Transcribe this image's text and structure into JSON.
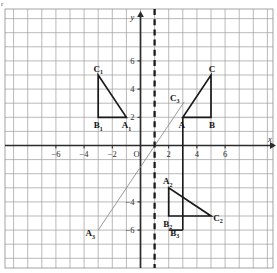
{
  "figure": {
    "kind": "coordinate-grid-geometry-diagram",
    "corner_mark": "r"
  },
  "axes": {
    "x_axis_name": "x",
    "y_axis_name": "y",
    "origin_label": "O",
    "x_ticks": [
      {
        "value": -6,
        "label": "−6"
      },
      {
        "value": -4,
        "label": "−4"
      },
      {
        "value": -2,
        "label": "−2"
      },
      {
        "value": 2,
        "label": "2"
      },
      {
        "value": 4,
        "label": "4"
      },
      {
        "value": 6,
        "label": "6"
      }
    ],
    "y_ticks": [
      {
        "value": 6,
        "label": "6"
      },
      {
        "value": 4,
        "label": "4"
      },
      {
        "value": 2,
        "label": "2"
      },
      {
        "value": -4,
        "label": "−4"
      },
      {
        "value": -6,
        "label": "−6"
      }
    ],
    "x_range": [
      -9,
      9
    ],
    "y_range": [
      -7.5,
      8
    ],
    "grid": true,
    "grid_color": "#8d8d8d",
    "axis_color": "#2b2b2b"
  },
  "mirror_line": {
    "label": "",
    "x_value": 1,
    "style": "dashed",
    "color": "#1a1a1a"
  },
  "shapes": [
    {
      "name": "triangle-ABC",
      "color": "#1a1a1a",
      "vertices": [
        {
          "label": "A",
          "x": 3,
          "y": 2
        },
        {
          "label": "B",
          "x": 5,
          "y": 2
        },
        {
          "label": "C",
          "x": 5,
          "y": 5
        }
      ]
    },
    {
      "name": "triangle-A1B1C1",
      "color": "#1a1a1a",
      "vertices": [
        {
          "label": "A₁",
          "x": -1,
          "y": 2
        },
        {
          "label": "B₁",
          "x": -3,
          "y": 2
        },
        {
          "label": "C₁",
          "x": -3,
          "y": 5
        }
      ]
    },
    {
      "name": "triangle-A2B2C2",
      "color": "#1a1a1a",
      "vertices": [
        {
          "label": "A₂",
          "x": 2,
          "y": -3
        },
        {
          "label": "B₂",
          "x": 2,
          "y": -5
        },
        {
          "label": "C₂",
          "x": 5,
          "y": -5
        }
      ]
    }
  ],
  "extra_labels": [
    {
      "label": "C₃",
      "x": 3,
      "y": 3.15
    },
    {
      "label": "B₃",
      "x": 3,
      "y": -6.4
    },
    {
      "label": "A₃",
      "x": -3,
      "y": -6.45
    }
  ],
  "construction_lines": [
    {
      "name": "ray-A3-to-C3",
      "from": {
        "x": -3,
        "y": -6
      },
      "to": {
        "x": 3.1,
        "y": 3.1
      },
      "color": "#8f8f8f"
    },
    {
      "name": "segment-A-to-B3",
      "from": {
        "x": 3,
        "y": 2
      },
      "to": {
        "x": 3,
        "y": -6
      },
      "color": "#1a1a1a"
    },
    {
      "name": "segment-B3-to-B2vert",
      "from": {
        "x": 2,
        "y": -6
      },
      "to": {
        "x": 3,
        "y": -6
      },
      "color": "#1a1a1a"
    }
  ]
}
